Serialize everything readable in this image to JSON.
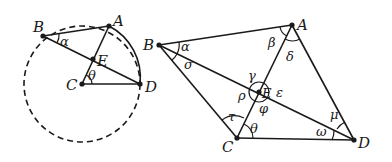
{
  "figure_left": {
    "points": {
      "B": "B",
      "A": "A",
      "E": "E",
      "C": "C",
      "D": "D"
    },
    "angles": {
      "alpha": "α",
      "theta": "θ"
    }
  },
  "figure_right": {
    "points": {
      "B": "B",
      "A": "A",
      "E": "E",
      "C": "C",
      "D": "D"
    },
    "angles": {
      "alpha": "α",
      "sigma": "σ",
      "beta": "β",
      "delta": "δ",
      "gamma": "γ",
      "epsilon": "ε",
      "rho": "ρ",
      "phi": "φ",
      "tau": "τ",
      "theta": "θ",
      "omega": "ω",
      "mu": "μ"
    }
  },
  "colors": {
    "ink": "#1a1a1a",
    "background": "#ffffff"
  }
}
